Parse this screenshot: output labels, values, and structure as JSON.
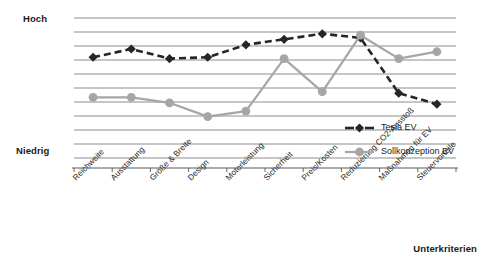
{
  "chart_data": {
    "type": "line",
    "title": "",
    "xlabel": "Unterkriterien",
    "ylabel": "",
    "ylim": [
      0,
      10
    ],
    "grid": true,
    "gridlines": 11,
    "legend_position": "bottom-right",
    "y_axis_ticklabels": [
      "Hoch",
      "Niedrig"
    ],
    "y_top_label": "Hoch",
    "y_bottom_label": "Niedrig",
    "categories": [
      "Reichweite",
      "Ausstattung",
      "Größe & Breite",
      "Design",
      "Motorleistung",
      "Sicherheit",
      "Preis/Kosten",
      "Reduzierung CO2-Ausstoß",
      "Maßnahmen für EV",
      "Steuervorteile"
    ],
    "series": [
      {
        "name": "Tesla EV",
        "color": "#262626",
        "marker": "diamond",
        "linestyle": "dashed",
        "values": [
          7.3,
          7.9,
          7.2,
          7.3,
          8.2,
          8.6,
          9.0,
          8.7,
          4.7,
          3.9
        ]
      },
      {
        "name": "Sollkonzeption EV",
        "color": "#a6a6a6",
        "marker": "circle",
        "linestyle": "solid",
        "values": [
          4.4,
          4.4,
          4.0,
          3.0,
          3.4,
          7.2,
          4.8,
          8.9,
          7.2,
          7.7
        ]
      }
    ]
  },
  "colors": {
    "tesla": "#262626",
    "sollkonzeption": "#a6a6a6",
    "gridline": "#808080",
    "axis": "#595959",
    "text": "#1a1a1a",
    "background": "#ffffff"
  }
}
